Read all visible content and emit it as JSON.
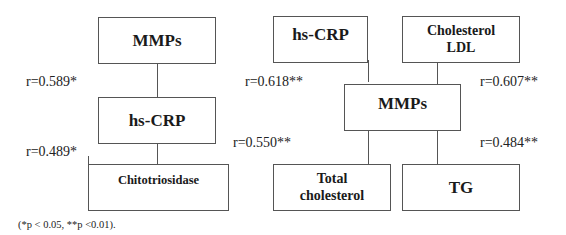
{
  "left_diagram": {
    "boxes": {
      "top": "MMPs",
      "middle": "hs-CRP",
      "bottom": "Chitotriosidase"
    },
    "correlations": [
      {
        "from": "MMPs",
        "to": "hs-CRP",
        "label": "r=0.589*"
      },
      {
        "from": "hs-CRP",
        "to": "Chitotriosidase",
        "label": "r=0.489*"
      }
    ]
  },
  "right_diagram": {
    "boxes": {
      "top_left": "hs-CRP",
      "top_right_line1": "Cholesterol",
      "top_right_line2": "LDL",
      "center": "MMPs",
      "bottom_left_line1": "Total",
      "bottom_left_line2": "cholesterol",
      "bottom_right": "TG"
    },
    "correlations": [
      {
        "from": "hs-CRP",
        "to": "MMPs",
        "label": "r=0.618**"
      },
      {
        "from": "Cholesterol LDL",
        "to": "MMPs",
        "label": "r=0.607**"
      },
      {
        "from": "MMPs",
        "to": "Total cholesterol",
        "label": "r=0.550**"
      },
      {
        "from": "MMPs",
        "to": "TG",
        "label": "r=0.484**"
      }
    ]
  },
  "footnote": "(*p < 0.05, **p <0.01)."
}
